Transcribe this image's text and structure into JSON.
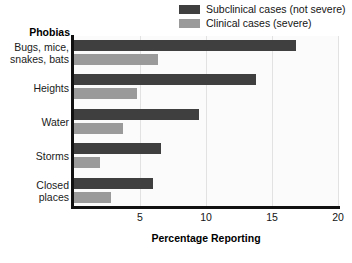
{
  "chart_data": {
    "type": "bar",
    "orientation": "horizontal",
    "title": "",
    "xlabel": "Percentage Reporting",
    "ylabel": "Phobias",
    "categories": [
      "Bugs, mice, snakes, bats",
      "Heights",
      "Water",
      "Storms",
      "Closed places"
    ],
    "series": [
      {
        "name": "Subclinical cases (not severe)",
        "color": "#3f3f3f",
        "values": [
          16.8,
          13.8,
          9.5,
          6.6,
          6.0
        ]
      },
      {
        "name": "Clinical cases (severe)",
        "color": "#9a9a9a",
        "values": [
          6.4,
          4.8,
          3.7,
          2.0,
          2.8
        ]
      }
    ],
    "xlim": [
      0,
      20
    ],
    "xticks": [
      5,
      10,
      15,
      20
    ],
    "xtick_labels": [
      "5",
      "10",
      "15",
      "20"
    ],
    "grid": true,
    "grid_axis": "x",
    "legend_position": "top-right"
  },
  "axes": {
    "category_axis_title": "Phobias",
    "value_axis_title": "Percentage Reporting"
  },
  "legend": {
    "entries": [
      {
        "label": "Subclinical cases (not severe)",
        "color": "#3f3f3f"
      },
      {
        "label": "Clinical cases (severe)",
        "color": "#9a9a9a"
      }
    ]
  },
  "category_labels": [
    {
      "line1": "Bugs, mice,",
      "line2": "snakes, bats"
    },
    {
      "line1": "Heights",
      "line2": ""
    },
    {
      "line1": "Water",
      "line2": ""
    },
    {
      "line1": "Storms",
      "line2": ""
    },
    {
      "line1": "Closed",
      "line2": "places"
    }
  ]
}
